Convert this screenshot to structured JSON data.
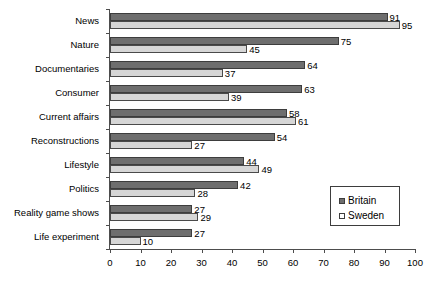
{
  "chart_data": {
    "type": "bar",
    "orientation": "horizontal",
    "title": "",
    "xlabel": "",
    "ylabel": "",
    "xlim": [
      0,
      100
    ],
    "xticks": [
      0,
      10,
      20,
      30,
      40,
      50,
      60,
      70,
      80,
      90,
      100
    ],
    "grid": false,
    "legend_position": "center-right",
    "categories": [
      "News",
      "Nature",
      "Documentaries",
      "Consumer",
      "Current affairs",
      "Reconstructions",
      "Lifestyle",
      "Politics",
      "Reality game shows",
      "Life experiment"
    ],
    "series": [
      {
        "name": "Britain",
        "color": "#6e6e6e",
        "values": [
          91,
          75,
          64,
          63,
          58,
          54,
          44,
          42,
          27,
          27
        ]
      },
      {
        "name": "Sweden",
        "color": "#d6d6d6",
        "values": [
          95,
          45,
          37,
          39,
          61,
          27,
          49,
          28,
          29,
          10
        ]
      }
    ]
  },
  "legend": {
    "items": [
      {
        "label": "Britain",
        "swatch": "britain"
      },
      {
        "label": "Sweden",
        "swatch": "sweden"
      }
    ]
  }
}
